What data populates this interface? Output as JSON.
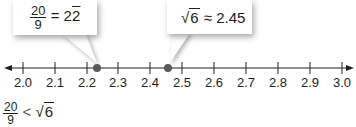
{
  "callouts": [
    {
      "numerator": "20",
      "denominator": "9",
      "relation": "=",
      "value_int": "2.",
      "value_repeating": "2",
      "target_value": 2.222
    },
    {
      "radical": "√",
      "radicand": "6",
      "relation": "≈",
      "value": "2.45",
      "target_value": 2.449
    }
  ],
  "number_line": {
    "min": 2.0,
    "max": 3.0,
    "step": 0.1,
    "tick_labels": [
      "2.0",
      "2.1",
      "2.2",
      "2.3",
      "2.4",
      "2.5",
      "2.6",
      "2.7",
      "2.8",
      "2.9",
      "3.0"
    ],
    "points": [
      {
        "label": "20/9",
        "value": 2.222
      },
      {
        "label": "√6",
        "value": 2.449
      }
    ],
    "point_color": "#5a5a5a",
    "line_color": "#231f20"
  },
  "statement": {
    "numerator": "20",
    "denominator": "9",
    "relation": "<",
    "radical": "√",
    "radicand": "6"
  }
}
